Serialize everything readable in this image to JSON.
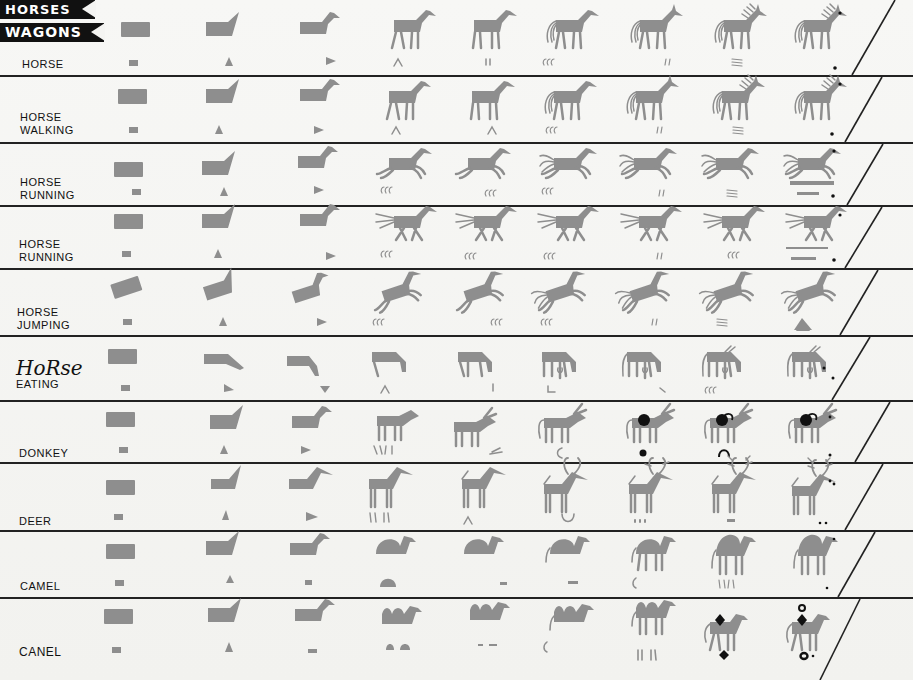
{
  "banners": {
    "horses": "HORSES",
    "wagons": "WAGONS"
  },
  "rows": [
    {
      "label_lines": [
        "HORSE"
      ],
      "stages": 9
    },
    {
      "label_lines": [
        "HORSE",
        "WALKING"
      ],
      "stages": 9
    },
    {
      "label_lines": [
        "HORSE",
        "RUNNING"
      ],
      "stages": 9
    },
    {
      "label_lines": [
        "HORSE",
        "RUNNING"
      ],
      "stages": 9
    },
    {
      "label_lines": [
        "HORSE",
        "JUMPING"
      ],
      "stages": 9
    },
    {
      "label_lines": [
        "HoRse",
        "EATING"
      ],
      "stages": 9
    },
    {
      "label_lines": [
        "DONKEY"
      ],
      "stages": 9
    },
    {
      "label_lines": [
        "DEER"
      ],
      "stages": 9
    },
    {
      "label_lines": [
        "CAMEL"
      ],
      "stages": 9
    },
    {
      "label_lines": [
        "CANEL"
      ],
      "stages": 9
    }
  ],
  "colors": {
    "sprite_gray": "#8e8e8e",
    "ink": "#111111",
    "paper": "#f4f4f2"
  }
}
